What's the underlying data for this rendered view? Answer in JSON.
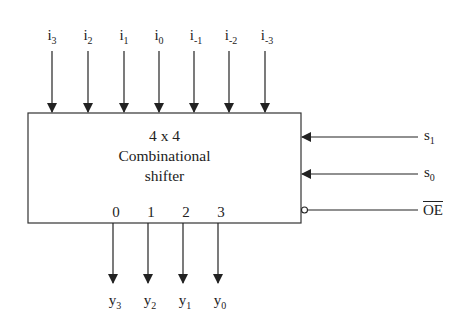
{
  "diagram": {
    "block": {
      "line1": "4 x 4",
      "line2": "Combinational",
      "line3": "shifter"
    },
    "inputs": [
      {
        "base": "i",
        "sub": "3"
      },
      {
        "base": "i",
        "sub": "2"
      },
      {
        "base": "i",
        "sub": "1"
      },
      {
        "base": "i",
        "sub": "0"
      },
      {
        "base": "i",
        "sub": "-1"
      },
      {
        "base": "i",
        "sub": "-2"
      },
      {
        "base": "i",
        "sub": "-3"
      }
    ],
    "output_pins": [
      "0",
      "1",
      "2",
      "3"
    ],
    "outputs": [
      {
        "base": "y",
        "sub": "3"
      },
      {
        "base": "y",
        "sub": "2"
      },
      {
        "base": "y",
        "sub": "1"
      },
      {
        "base": "y",
        "sub": "0"
      }
    ],
    "controls": [
      {
        "base": "s",
        "sub": "1"
      },
      {
        "base": "s",
        "sub": "0"
      },
      {
        "label": "OE",
        "active_low": true
      }
    ],
    "colors": {
      "line": "#222222",
      "background": "#ffffff"
    }
  }
}
